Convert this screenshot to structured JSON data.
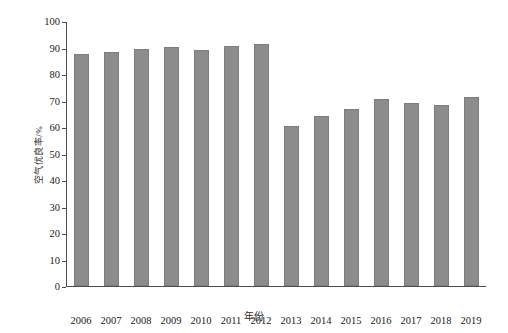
{
  "chart_data": {
    "type": "bar",
    "title": "",
    "subtitle": "",
    "xlabel": "年份",
    "ylabel": "空气优良率/%",
    "categories": [
      "2006",
      "2007",
      "2008",
      "2009",
      "2010",
      "2011",
      "2012",
      "2013",
      "2014",
      "2015",
      "2016",
      "2017",
      "2018",
      "2019"
    ],
    "values": [
      87.5,
      88.3,
      89.4,
      90.2,
      89.0,
      90.7,
      91.4,
      60.3,
      64.2,
      66.9,
      70.4,
      69.0,
      68.2,
      71.3
    ],
    "series": [
      {
        "name": "空气优良率",
        "values": [
          87.5,
          88.3,
          89.4,
          90.2,
          89.0,
          90.7,
          91.4,
          60.3,
          64.2,
          66.9,
          70.4,
          69.0,
          68.2,
          71.3
        ]
      }
    ],
    "ylim": [
      0,
      100
    ],
    "ytick_values": [
      0,
      10,
      20,
      30,
      40,
      50,
      60,
      70,
      80,
      90,
      100
    ],
    "ytick_labels": [
      "0",
      "10",
      "20",
      "30",
      "40",
      "50",
      "60",
      "70",
      "80",
      "90",
      "100"
    ],
    "xtick_labels": [
      "2006",
      "2007",
      "2008",
      "2009",
      "2010",
      "2011",
      "2012",
      "2013",
      "2014",
      "2015",
      "2016",
      "2017",
      "2018",
      "2019"
    ],
    "grid": false,
    "legend": false,
    "legend_position": "none",
    "bar_color": "#8c8c8c",
    "axis_color": "#4d4d4d",
    "background_color": "#ffffff",
    "annotations": []
  }
}
